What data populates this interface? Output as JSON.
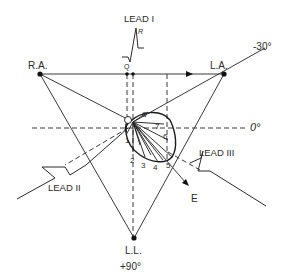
{
  "figure": {
    "electrodes": {
      "ra": {
        "label": "R.A."
      },
      "la": {
        "label": "L.A."
      },
      "ll": {
        "label": "L.L."
      }
    },
    "leads": {
      "lead1": {
        "label": "LEAD I",
        "q_label": "Q",
        "r_label": "R"
      },
      "lead2": {
        "label": "LEAD II"
      },
      "lead3": {
        "label": "LEAD III"
      }
    },
    "axes": {
      "minus30": {
        "label": "-30°"
      },
      "zero": {
        "label": "0°"
      },
      "plus90": {
        "label": "+90°"
      }
    },
    "center": {
      "label": "O"
    },
    "vector": {
      "label": "E"
    },
    "loop_points": [
      "1",
      "2",
      "3",
      "4",
      "5",
      "6",
      "7",
      "8"
    ],
    "colors": {
      "ink": "#2a2a2a",
      "background": "#ffffff"
    }
  }
}
